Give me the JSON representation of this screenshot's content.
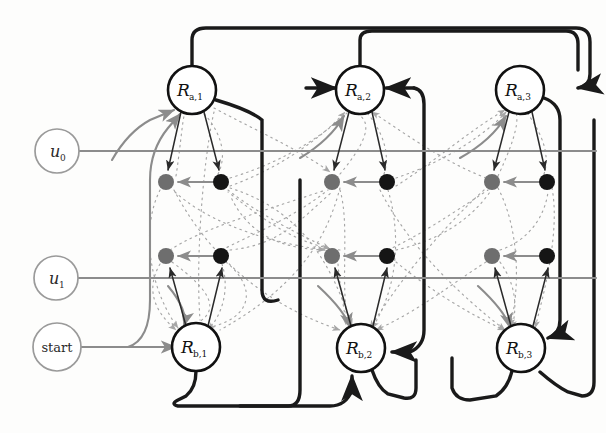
{
  "diagram": {
    "colors": {
      "background": "#fdfdfc",
      "strong_edge": "#1a1a1a",
      "gray_edge": "#8c8c8c",
      "dotted_edge": "#a6a6a6",
      "node_stroke_strong": "#111111",
      "node_stroke_light": "#9a9a9a",
      "dot_gray": "#6e6e6e",
      "dot_black": "#151515",
      "text": "#111111"
    },
    "input_nodes": [
      {
        "id": "u0",
        "label": "u",
        "sub": "0",
        "cx": 57,
        "cy": 151,
        "r": 22,
        "style": "light"
      },
      {
        "id": "u1",
        "label": "u",
        "sub": "1",
        "cx": 56,
        "cy": 278,
        "r": 22,
        "style": "light"
      },
      {
        "id": "start",
        "label": "start",
        "sub": "",
        "cx": 57,
        "cy": 347,
        "r": 24,
        "style": "light"
      }
    ],
    "region_nodes": [
      {
        "id": "Ra1",
        "label": "R",
        "sub": "a,1",
        "cx": 192,
        "cy": 90,
        "r": 24,
        "style": "strong"
      },
      {
        "id": "Ra2",
        "label": "R",
        "sub": "a,2",
        "cx": 360,
        "cy": 90,
        "r": 24,
        "style": "strong"
      },
      {
        "id": "Ra3",
        "label": "R",
        "sub": "a,3",
        "cx": 520,
        "cy": 90,
        "r": 24,
        "style": "strong"
      },
      {
        "id": "Rb1",
        "label": "R",
        "sub": "b,1",
        "cx": 196,
        "cy": 347,
        "r": 24,
        "style": "strong"
      },
      {
        "id": "Rb2",
        "label": "R",
        "sub": "b,2",
        "cx": 361,
        "cy": 348,
        "r": 24,
        "style": "strong"
      },
      {
        "id": "Rb3",
        "label": "R",
        "sub": "b,3",
        "cx": 521,
        "cy": 348,
        "r": 24,
        "style": "strong"
      }
    ],
    "dot_nodes": [
      {
        "id": "d-c1-r1-g",
        "cx": 166,
        "cy": 182,
        "r": 8,
        "fill": "gray"
      },
      {
        "id": "d-c1-r1-b",
        "cx": 221,
        "cy": 182,
        "r": 8,
        "fill": "black"
      },
      {
        "id": "d-c1-r2-g",
        "cx": 166,
        "cy": 256,
        "r": 8,
        "fill": "gray"
      },
      {
        "id": "d-c1-r2-b",
        "cx": 221,
        "cy": 256,
        "r": 8,
        "fill": "black"
      },
      {
        "id": "d-c2-r1-g",
        "cx": 332,
        "cy": 182,
        "r": 8,
        "fill": "gray"
      },
      {
        "id": "d-c2-r1-b",
        "cx": 387,
        "cy": 182,
        "r": 8,
        "fill": "black"
      },
      {
        "id": "d-c2-r2-g",
        "cx": 332,
        "cy": 256,
        "r": 8,
        "fill": "gray"
      },
      {
        "id": "d-c2-r2-b",
        "cx": 387,
        "cy": 256,
        "r": 8,
        "fill": "black"
      },
      {
        "id": "d-c3-r1-g",
        "cx": 492,
        "cy": 182,
        "r": 8,
        "fill": "gray"
      },
      {
        "id": "d-c3-r1-b",
        "cx": 547,
        "cy": 182,
        "r": 8,
        "fill": "black"
      },
      {
        "id": "d-c3-r2-g",
        "cx": 492,
        "cy": 256,
        "r": 8,
        "fill": "gray"
      },
      {
        "id": "d-c3-r2-b",
        "cx": 547,
        "cy": 256,
        "r": 8,
        "fill": "black"
      }
    ],
    "gray_input_lines": [
      {
        "from": "u0",
        "to": "right-edge",
        "y": 151
      },
      {
        "from": "u1",
        "to": "right-edge",
        "y": 278
      },
      {
        "from": "start",
        "to": "Rb1",
        "y": 347
      }
    ],
    "legend_note": "solid black = region transitions, gray = input/start wiring, dotted = cross couplings"
  }
}
